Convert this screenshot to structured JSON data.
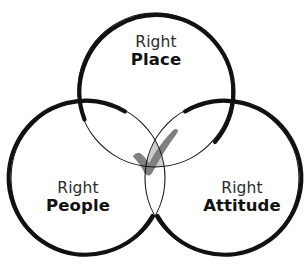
{
  "diagram": {
    "type": "venn-3-circle",
    "background_color": "#ffffff",
    "title": "",
    "stroke_color": "#111111",
    "thick_stroke_px": 4.2,
    "thin_stroke_px": 1.1,
    "intersection_fill": "#cccccc",
    "check_color": "#808080",
    "sets": [
      {
        "id": "place",
        "position": "top",
        "line1": "Right",
        "line2": "Place",
        "cx": 155,
        "cy": 90,
        "r": 77
      },
      {
        "id": "people",
        "position": "bottom-left",
        "line1": "Right",
        "line2": "People",
        "cx": 88,
        "cy": 178,
        "r": 77
      },
      {
        "id": "attitude",
        "position": "bottom-right",
        "line1": "Right",
        "line2": "Attitude",
        "cx": 222,
        "cy": 178,
        "r": 77
      }
    ],
    "center": {
      "icon": "check-icon",
      "label": "",
      "meaning": "all three overlap"
    }
  }
}
